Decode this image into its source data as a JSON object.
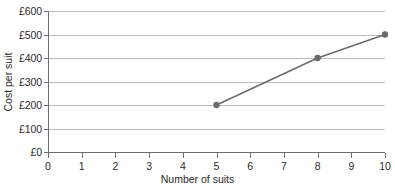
{
  "chart_data": {
    "type": "line",
    "title": "",
    "xlabel": "Number of suits",
    "ylabel": "Cost per suit",
    "x": [
      5,
      8,
      10
    ],
    "values": [
      200,
      400,
      500
    ],
    "series": [
      {
        "name": "Cost per suit",
        "points": [
          {
            "x": 5,
            "y": 200,
            "label": "£200"
          },
          {
            "x": 8,
            "y": 400,
            "label": "£400"
          },
          {
            "x": 10,
            "y": 500,
            "label": "£500"
          }
        ]
      }
    ],
    "xlim": [
      0,
      10
    ],
    "ylim": [
      0,
      600
    ],
    "x_ticks": [
      0,
      1,
      2,
      3,
      4,
      5,
      6,
      7,
      8,
      9,
      10
    ],
    "x_tick_labels": [
      "0",
      "1",
      "2",
      "3",
      "4",
      "5",
      "6",
      "7",
      "8",
      "9",
      "10"
    ],
    "y_ticks": [
      0,
      100,
      200,
      300,
      400,
      500,
      600
    ],
    "y_tick_labels": [
      "£0",
      "£100",
      "£200",
      "£300",
      "£400",
      "£500",
      "£600"
    ],
    "grid": "horizontal",
    "legend": "none",
    "currency": "£",
    "colors": {
      "line": "#6b6b6b",
      "marker": "#6b6b6b",
      "gridline": "#bcbcbc",
      "axis": "#6e6e6e",
      "text": "#2b2b2b",
      "background": "#ffffff"
    },
    "marker": {
      "shape": "circle",
      "radius": 3.2
    }
  }
}
